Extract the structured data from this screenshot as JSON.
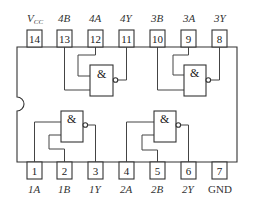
{
  "top_pins": [
    {
      "number": "14",
      "label": "V",
      "sub": "CC"
    },
    {
      "number": "13",
      "label": "4B"
    },
    {
      "number": "12",
      "label": "4A"
    },
    {
      "number": "11",
      "label": "4Y"
    },
    {
      "number": "10",
      "label": "3B"
    },
    {
      "number": "9",
      "label": "3A"
    },
    {
      "number": "8",
      "label": "3Y"
    }
  ],
  "bottom_pins": [
    {
      "number": "1",
      "label": "1A"
    },
    {
      "number": "2",
      "label": "1B"
    },
    {
      "number": "3",
      "label": "1Y"
    },
    {
      "number": "4",
      "label": "2A"
    },
    {
      "number": "5",
      "label": "2B"
    },
    {
      "number": "6",
      "label": "2Y"
    },
    {
      "number": "7",
      "label": "GND"
    }
  ],
  "gates": [
    {
      "name": "gate-4",
      "symbol": "&",
      "inputs": [
        "4A",
        "4B"
      ],
      "output": "4Y"
    },
    {
      "name": "gate-3",
      "symbol": "&",
      "inputs": [
        "3A",
        "3B"
      ],
      "output": "3Y"
    },
    {
      "name": "gate-1",
      "symbol": "&",
      "inputs": [
        "1A",
        "1B"
      ],
      "output": "1Y"
    },
    {
      "name": "gate-2",
      "symbol": "&",
      "inputs": [
        "2A",
        "2B"
      ],
      "output": "2Y"
    }
  ],
  "colors": {
    "line": "#333333",
    "background": "#ffffff"
  }
}
